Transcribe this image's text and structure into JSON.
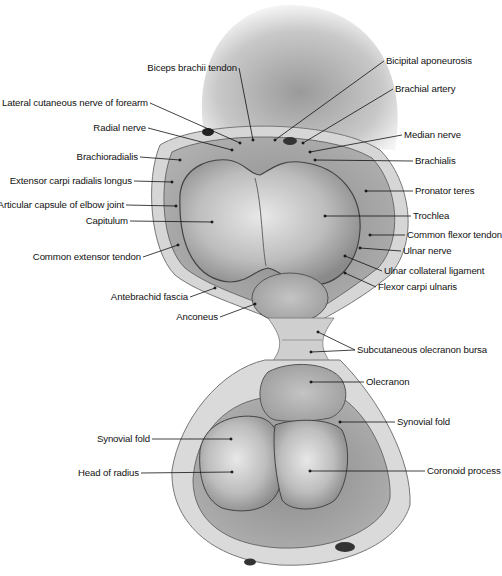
{
  "figure": {
    "labels_left": [
      {
        "id": "biceps-brachii-tendon",
        "text": "Biceps brachii tendon",
        "x": 237,
        "y": 68,
        "px": 253,
        "py": 140
      },
      {
        "id": "lateral-cutaneous-nerve",
        "text": "Lateral cutaneous nerve of forearm",
        "x": 148,
        "y": 103,
        "px": 240,
        "py": 143
      },
      {
        "id": "radial-nerve",
        "text": "Radial nerve",
        "x": 146,
        "y": 128,
        "px": 232,
        "py": 150
      },
      {
        "id": "brachioradialis",
        "text": "Brachioradialis",
        "x": 138,
        "y": 157,
        "px": 180,
        "py": 160
      },
      {
        "id": "extensor-carpi-radialis-longus",
        "text": "Extensor carpi radialis longus",
        "x": 132,
        "y": 181,
        "px": 172,
        "py": 182
      },
      {
        "id": "articular-capsule",
        "text": "Articular capsule of elbow joint",
        "x": 124,
        "y": 205,
        "px": 176,
        "py": 206
      },
      {
        "id": "capitulum",
        "text": "Capitulum",
        "x": 128,
        "y": 221,
        "px": 212,
        "py": 222
      },
      {
        "id": "common-extensor-tendon",
        "text": "Common extensor tendon",
        "x": 141,
        "y": 257,
        "px": 178,
        "py": 245
      },
      {
        "id": "antebrachid-fascia",
        "text": "Antebrachid fascia",
        "x": 188,
        "y": 297,
        "px": 215,
        "py": 288
      },
      {
        "id": "anconeus",
        "text": "Anconeus",
        "x": 218,
        "y": 317,
        "px": 255,
        "py": 304
      },
      {
        "id": "synovial-fold-left",
        "text": "Synovial fold",
        "x": 150,
        "y": 439,
        "px": 231,
        "py": 439
      },
      {
        "id": "head-of-radius",
        "text": "Head of radius",
        "x": 139,
        "y": 473,
        "px": 232,
        "py": 472
      }
    ],
    "labels_right": [
      {
        "id": "bicipital-aponeurosis",
        "text": "Bicipital aponeurosis",
        "x": 386,
        "y": 61,
        "px": 275,
        "py": 140
      },
      {
        "id": "brachial-artery",
        "text": "Brachial artery",
        "x": 395,
        "y": 89,
        "px": 303,
        "py": 143
      },
      {
        "id": "median-nerve",
        "text": "Median nerve",
        "x": 404,
        "y": 135,
        "px": 310,
        "py": 152
      },
      {
        "id": "brachialis",
        "text": "Brachialis",
        "x": 415,
        "y": 161,
        "px": 315,
        "py": 160
      },
      {
        "id": "pronator-teres",
        "text": "Pronator teres",
        "x": 415,
        "y": 191,
        "px": 366,
        "py": 191
      },
      {
        "id": "trochlea",
        "text": "Trochlea",
        "x": 413,
        "y": 216,
        "px": 325,
        "py": 216
      },
      {
        "id": "common-flexor-tendon",
        "text": "Common flexor tendon",
        "x": 407,
        "y": 235,
        "px": 370,
        "py": 235
      },
      {
        "id": "ulnar-nerve",
        "text": "Ulnar nerve",
        "x": 403,
        "y": 251,
        "px": 360,
        "py": 248
      },
      {
        "id": "ulnar-collateral-ligament",
        "text": "Ulnar collateral ligament",
        "x": 384,
        "y": 271,
        "px": 345,
        "py": 256
      },
      {
        "id": "flexor-carpi-ulnaris",
        "text": "Flexor carpi ulnaris",
        "x": 378,
        "y": 287,
        "px": 345,
        "py": 273
      },
      {
        "id": "subcutaneous-olecranon-bursa",
        "text": "Subcutaneous olecranon bursa",
        "x": 357,
        "y": 350,
        "px": 318,
        "py": 332,
        "px2": 311,
        "py2": 352
      },
      {
        "id": "olecranon",
        "text": "Olecranon",
        "x": 366,
        "y": 382,
        "px": 311,
        "py": 382
      },
      {
        "id": "synovial-fold-right",
        "text": "Synovial fold",
        "x": 397,
        "y": 422,
        "px": 340,
        "py": 422
      },
      {
        "id": "coronoid-process",
        "text": "Coronoid process",
        "x": 427,
        "y": 471,
        "px": 310,
        "py": 471
      }
    ]
  }
}
